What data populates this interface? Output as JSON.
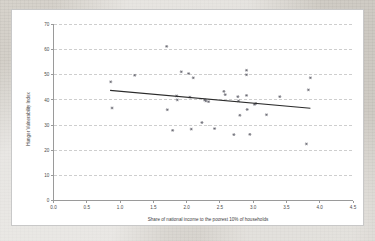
{
  "chart_data": {
    "type": "scatter",
    "title": "",
    "xlabel": "Share of national income to the poorest 10% of households",
    "ylabel": "Hunger Vulnerability Index",
    "xlim": [
      0.0,
      4.5
    ],
    "ylim": [
      0,
      70
    ],
    "xticks": [
      "0.0",
      "0.5",
      "1.0",
      "1.5",
      "2.0",
      "2.5",
      "3.0",
      "3.5",
      "4.0",
      "4.5"
    ],
    "yticks": [
      "0",
      "10",
      "20",
      "30",
      "40",
      "50",
      "60",
      "70"
    ],
    "grid": "horizontal-dashed",
    "legend": "none",
    "marker_style": "star",
    "marker_color": "#5c5c66",
    "trendline_color": "#2b2b2b",
    "points": [
      {
        "x": 0.86,
        "y": 47.2
      },
      {
        "x": 0.88,
        "y": 36.8
      },
      {
        "x": 1.22,
        "y": 49.8
      },
      {
        "x": 1.7,
        "y": 61.3
      },
      {
        "x": 1.71,
        "y": 36.1
      },
      {
        "x": 1.79,
        "y": 27.9
      },
      {
        "x": 1.85,
        "y": 41.6
      },
      {
        "x": 1.86,
        "y": 40.0
      },
      {
        "x": 1.92,
        "y": 51.2
      },
      {
        "x": 2.03,
        "y": 50.5
      },
      {
        "x": 2.05,
        "y": 41.1
      },
      {
        "x": 2.07,
        "y": 28.4
      },
      {
        "x": 2.1,
        "y": 48.8
      },
      {
        "x": 2.23,
        "y": 31.0
      },
      {
        "x": 2.27,
        "y": 40.0
      },
      {
        "x": 2.29,
        "y": 39.6
      },
      {
        "x": 2.33,
        "y": 39.3
      },
      {
        "x": 2.42,
        "y": 28.6
      },
      {
        "x": 2.56,
        "y": 43.4
      },
      {
        "x": 2.58,
        "y": 42.1
      },
      {
        "x": 2.71,
        "y": 26.2
      },
      {
        "x": 2.77,
        "y": 41.3
      },
      {
        "x": 2.78,
        "y": 39.6
      },
      {
        "x": 2.8,
        "y": 33.9
      },
      {
        "x": 2.9,
        "y": 51.8
      },
      {
        "x": 2.9,
        "y": 50.0
      },
      {
        "x": 2.9,
        "y": 41.8
      },
      {
        "x": 2.91,
        "y": 36.2
      },
      {
        "x": 2.95,
        "y": 26.3
      },
      {
        "x": 3.02,
        "y": 38.2
      },
      {
        "x": 3.04,
        "y": 38.6
      },
      {
        "x": 3.2,
        "y": 34.1
      },
      {
        "x": 3.4,
        "y": 41.3
      },
      {
        "x": 3.8,
        "y": 22.5
      },
      {
        "x": 3.83,
        "y": 44.0
      },
      {
        "x": 3.86,
        "y": 48.8
      }
    ],
    "trendline": {
      "x0": 0.85,
      "y0": 43.8,
      "x1": 3.86,
      "y1": 36.7
    }
  }
}
